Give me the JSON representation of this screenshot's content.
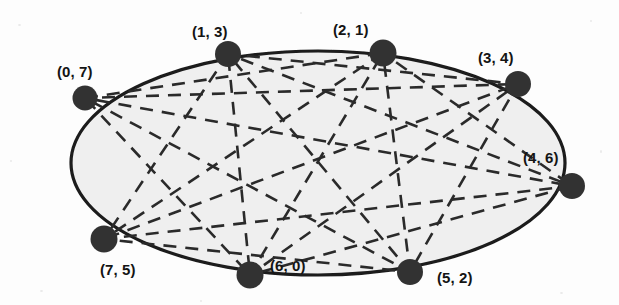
{
  "figure": {
    "background_color": "#fdfdfd",
    "ellipse_fill_color": "#efefef",
    "ellipse_stroke_color": "#1a1a1a",
    "node_color": "#333333",
    "chord_color": "#2b2b2b",
    "label_color": "#141414",
    "width": 619,
    "height": 305
  },
  "ellipse": {
    "center_x": 318,
    "center_y": 163,
    "radius_x": 247,
    "radius_y": 112,
    "stroke_width": 3.2
  },
  "nodes": [
    {
      "id": 0,
      "label": "(0, 7)",
      "cx": 85,
      "cy": 98,
      "r": 12.5,
      "label_x": 57,
      "label_y": 64
    },
    {
      "id": 1,
      "label": "(1, 3)",
      "cx": 228,
      "cy": 54,
      "r": 13.0,
      "label_x": 192,
      "label_y": 24
    },
    {
      "id": 2,
      "label": "(2, 1)",
      "cx": 383,
      "cy": 53,
      "r": 13.5,
      "label_x": 333,
      "label_y": 22
    },
    {
      "id": 3,
      "label": "(3, 4)",
      "cx": 518,
      "cy": 84,
      "r": 13.0,
      "label_x": 478,
      "label_y": 50
    },
    {
      "id": 4,
      "label": "(4, 6)",
      "cx": 572,
      "cy": 186,
      "r": 13.0,
      "label_x": 523,
      "label_y": 150
    },
    {
      "id": 5,
      "label": "(5, 2)",
      "cx": 410,
      "cy": 272,
      "r": 13.0,
      "label_x": 437,
      "label_y": 270
    },
    {
      "id": 6,
      "label": "(6, 0)",
      "cx": 250,
      "cy": 275,
      "r": 13.5,
      "label_x": 270,
      "label_y": 258
    },
    {
      "id": 7,
      "label": "(7, 5)",
      "cx": 104,
      "cy": 239,
      "r": 13.5,
      "label_x": 100,
      "label_y": 262
    }
  ],
  "chords": [
    {
      "from": 0,
      "to": 2
    },
    {
      "from": 0,
      "to": 3
    },
    {
      "from": 0,
      "to": 4
    },
    {
      "from": 0,
      "to": 5
    },
    {
      "from": 0,
      "to": 6
    },
    {
      "from": 1,
      "to": 3
    },
    {
      "from": 1,
      "to": 4
    },
    {
      "from": 1,
      "to": 5
    },
    {
      "from": 1,
      "to": 6
    },
    {
      "from": 1,
      "to": 7
    },
    {
      "from": 2,
      "to": 4
    },
    {
      "from": 2,
      "to": 5
    },
    {
      "from": 2,
      "to": 6
    },
    {
      "from": 2,
      "to": 7
    },
    {
      "from": 3,
      "to": 5
    },
    {
      "from": 3,
      "to": 6
    },
    {
      "from": 3,
      "to": 7
    },
    {
      "from": 4,
      "to": 6
    },
    {
      "from": 4,
      "to": 7
    },
    {
      "from": 5,
      "to": 7
    }
  ],
  "chord_style": {
    "dash_pattern": "13 9",
    "stroke_width": 2.6
  }
}
